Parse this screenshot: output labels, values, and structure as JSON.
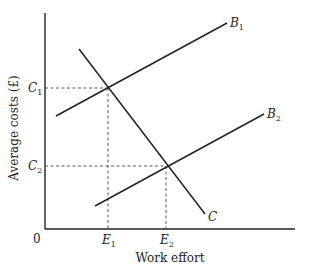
{
  "diagram": {
    "type": "economics-line-diagram",
    "axes": {
      "x_label": "Work effort",
      "y_label": "Average costs (£)",
      "origin_label": "0"
    },
    "lines": [
      {
        "id": "B1",
        "label": "B",
        "subscript": "1",
        "slope": "upward"
      },
      {
        "id": "B2",
        "label": "B",
        "subscript": "2",
        "slope": "upward"
      },
      {
        "id": "C",
        "label": "C",
        "subscript": "",
        "slope": "downward"
      }
    ],
    "intersections": [
      {
        "lines": [
          "B1",
          "C"
        ],
        "x_label": "E",
        "x_sub": "1",
        "y_label": "C",
        "y_sub": "1"
      },
      {
        "lines": [
          "B2",
          "C"
        ],
        "x_label": "E",
        "x_sub": "2",
        "y_label": "C",
        "y_sub": "2"
      }
    ],
    "colors": {
      "ink": "#222222",
      "background": "#ffffff"
    }
  }
}
